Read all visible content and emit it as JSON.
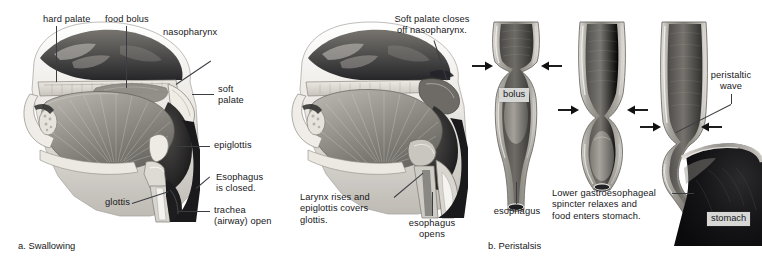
{
  "figure": {
    "panel_a": {
      "caption": "a. Swallowing",
      "labels": {
        "hard_palate": "hard palate",
        "food_bolus": "food bolus",
        "nasopharynx": "nasopharynx",
        "soft_palate": "soft\npalate",
        "epiglottis": "epiglottis",
        "esophagus_closed": "Esophagus\nis closed.",
        "trachea_open": "trachea\n(airway) open",
        "glottis": "glottis"
      }
    },
    "panel_a2": {
      "labels": {
        "soft_palate_closes": "Soft palate closes\noff nasopharynx.",
        "larynx_rises": "Larynx rises and\nepiglottis covers\nglottis.",
        "esophagus_opens": "esophagus\nopens"
      }
    },
    "panel_b": {
      "caption": "b. Peristalsis",
      "labels": {
        "bolus": "bolus",
        "esophagus": "esophagus",
        "peristaltic_wave": "peristaltic\nwave",
        "lower_sphincter": "Lower gastroesophageal\nspincter relaxes and\nfood enters stomach.",
        "stomach": "stomach"
      }
    },
    "colors": {
      "ink": "#17181a",
      "leader": "#3b3d42",
      "tag_bg": "#d7d7d5",
      "tissue_light": "#dedad4",
      "tissue_mid": "#9a9892",
      "tissue_dark": "#3a3a38",
      "muscle": "#8e8b84",
      "lumen_dark": "#2c2c2b",
      "arrow": "#111111"
    }
  }
}
